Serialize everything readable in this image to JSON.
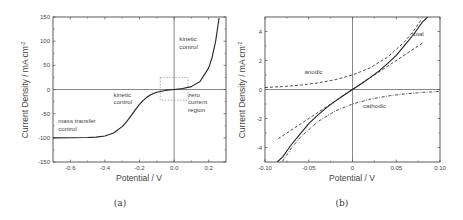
{
  "chart_data": [
    {
      "type": "line",
      "panel": "(a)",
      "xlabel": "Potential / V",
      "ylabel": "Current Density / mA cm",
      "ylabel_superscript": "-2",
      "xlim": [
        -0.7,
        0.3
      ],
      "ylim": [
        -150,
        150
      ],
      "xticks": [
        "-0.6",
        "-0.4",
        "-0.2",
        "0.0",
        "0.2"
      ],
      "xtick_values": [
        -0.6,
        -0.4,
        -0.2,
        0.0,
        0.2
      ],
      "yticks": [
        "150",
        "100",
        "50",
        "0",
        "-50",
        "-100",
        "-150"
      ],
      "ytick_values": [
        150,
        100,
        50,
        0,
        -50,
        -100,
        -150
      ],
      "grid": false,
      "series": [
        {
          "name": "current density",
          "style": "solid",
          "x": [
            -0.7,
            -0.6,
            -0.5,
            -0.45,
            -0.4,
            -0.35,
            -0.3,
            -0.28,
            -0.26,
            -0.24,
            -0.22,
            -0.2,
            -0.18,
            -0.16,
            -0.14,
            -0.12,
            -0.1,
            -0.05,
            0.0,
            0.05,
            0.1,
            0.15,
            0.2,
            0.22,
            0.24,
            0.26
          ],
          "y": [
            -100,
            -99.9,
            -99.4,
            -98.5,
            -96.1,
            -90.0,
            -76.8,
            -68.9,
            -59.8,
            -49.9,
            -40.0,
            -30.9,
            -23.1,
            -16.7,
            -11.9,
            -8.3,
            -5.7,
            -1.9,
            0.0,
            1.9,
            5.9,
            16.5,
            44.8,
            66.8,
            99.6,
            148
          ]
        }
      ],
      "annotations": [
        {
          "text": [
            "kinetic",
            "control"
          ],
          "x": 0.03,
          "y": 100
        },
        {
          "text": [
            "kinetic",
            "control"
          ],
          "x": -0.35,
          "y": -15
        },
        {
          "text": [
            "zero",
            "current",
            "region"
          ],
          "x": 0.08,
          "y": -15
        },
        {
          "text": [
            "mass transfer",
            "control"
          ],
          "x": -0.67,
          "y": -70
        }
      ],
      "inset_box": {
        "x": [
          -0.08,
          0.08
        ],
        "y": [
          25,
          -22
        ],
        "style": "dotted"
      },
      "caption": "(a)"
    },
    {
      "type": "line",
      "panel": "(b)",
      "xlabel": "Potential / V",
      "ylabel": "Current Density / mA cm",
      "ylabel_superscript": "-2",
      "xlim": [
        -0.1,
        0.1
      ],
      "ylim": [
        -5,
        5
      ],
      "xticks": [
        "-0.10",
        "-0.05",
        "0",
        "0.05",
        "0.10"
      ],
      "xtick_values": [
        -0.1,
        -0.05,
        0,
        0.05,
        0.1
      ],
      "yticks": [
        "4",
        "2",
        "0",
        "-2",
        "-4"
      ],
      "ytick_values": [
        4,
        2,
        0,
        -2,
        -4
      ],
      "grid": false,
      "series": [
        {
          "name": "total",
          "style": "solid",
          "x": [
            -0.086,
            -0.08,
            -0.07,
            -0.06,
            -0.05,
            -0.04,
            -0.03,
            -0.02,
            -0.01,
            0.0,
            0.01,
            0.02,
            0.03,
            0.04,
            0.05,
            0.06,
            0.07,
            0.08,
            0.086
          ],
          "y": [
            -5.0,
            -4.66,
            -3.81,
            -3.08,
            -2.35,
            -1.78,
            -1.27,
            -0.82,
            -0.4,
            0.0,
            0.4,
            0.82,
            1.27,
            1.78,
            2.35,
            3.08,
            3.81,
            4.66,
            5.0
          ]
        },
        {
          "name": "anodic",
          "style": "dashed",
          "x": [
            -0.1,
            -0.08,
            -0.06,
            -0.04,
            -0.02,
            0.0,
            0.02,
            0.04,
            0.06,
            0.07,
            0.08
          ],
          "y": [
            0.14,
            0.2,
            0.3,
            0.45,
            0.67,
            1.0,
            1.49,
            2.23,
            3.32,
            4.06,
            4.95
          ]
        },
        {
          "name": "cathodic",
          "style": "dash-dot",
          "x": [
            -0.08,
            -0.07,
            -0.06,
            -0.04,
            -0.02,
            0.0,
            0.02,
            0.04,
            0.06,
            0.08,
            0.1
          ],
          "y": [
            -4.95,
            -4.06,
            -3.32,
            -2.23,
            -1.49,
            -1.0,
            -0.67,
            -0.45,
            -0.3,
            -0.2,
            -0.14
          ]
        },
        {
          "name": "linear approximation",
          "style": "dashed",
          "x": [
            -0.085,
            0.08
          ],
          "y": [
            -3.4,
            3.2
          ]
        }
      ],
      "annotations": [
        {
          "text": "total",
          "x": 0.068,
          "y": 3.7
        },
        {
          "text": "anodic",
          "x": -0.055,
          "y": 1.1
        },
        {
          "text": "cathodic",
          "x": 0.012,
          "y": -1.3
        }
      ],
      "caption": "(b)"
    }
  ]
}
